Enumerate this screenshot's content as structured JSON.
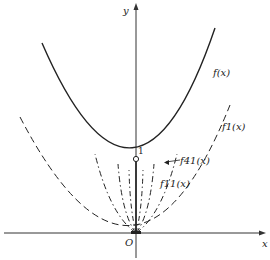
{
  "diagram": {
    "axes": {
      "x_label": "x",
      "y_label": "y",
      "origin_label": "O"
    },
    "point": {
      "label": "1",
      "description": "open circle on y-axis at y=1"
    },
    "curves": [
      {
        "id": "f",
        "label": "f(x)",
        "style": "solid",
        "description": "upper parabola-like curve with minimum 1 at x=0"
      },
      {
        "id": "f41",
        "label": "f41(x)",
        "style": "dash-dot",
        "description": "narrow curve from origin rising to meet f(x)"
      },
      {
        "id": "f11",
        "label": "f11(x)",
        "style": "dash-dot",
        "description": "narrow curve from origin"
      },
      {
        "id": "f1",
        "label": "f1(x)",
        "style": "dashed",
        "description": "wide parabola through origin"
      }
    ],
    "colors": {
      "ink": "#222222",
      "background": "#ffffff"
    }
  }
}
